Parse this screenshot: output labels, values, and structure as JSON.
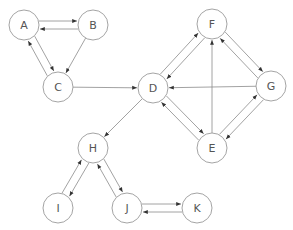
{
  "diagram": {
    "type": "directed-graph",
    "node_radius": 15,
    "colors": {
      "node_stroke": "#9a9a9a",
      "edge": "#8a8a8a",
      "label": "#555555",
      "background": "#ffffff"
    },
    "nodes": [
      {
        "id": "A",
        "label": "A",
        "x": 24,
        "y": 25
      },
      {
        "id": "B",
        "label": "B",
        "x": 93,
        "y": 25
      },
      {
        "id": "C",
        "label": "C",
        "x": 58,
        "y": 87
      },
      {
        "id": "D",
        "label": "D",
        "x": 153,
        "y": 88
      },
      {
        "id": "F",
        "label": "F",
        "x": 212,
        "y": 24
      },
      {
        "id": "G",
        "label": "G",
        "x": 271,
        "y": 86
      },
      {
        "id": "E",
        "label": "E",
        "x": 212,
        "y": 148
      },
      {
        "id": "H",
        "label": "H",
        "x": 93,
        "y": 148
      },
      {
        "id": "I",
        "label": "I",
        "x": 58,
        "y": 208
      },
      {
        "id": "J",
        "label": "J",
        "x": 127,
        "y": 208
      },
      {
        "id": "K",
        "label": "K",
        "x": 197,
        "y": 208
      }
    ],
    "edges": [
      {
        "from": "A",
        "to": "B",
        "offset": -4
      },
      {
        "from": "B",
        "to": "A",
        "offset": -4
      },
      {
        "from": "A",
        "to": "C",
        "offset": -4
      },
      {
        "from": "C",
        "to": "A",
        "offset": -4
      },
      {
        "from": "B",
        "to": "C",
        "offset": 0
      },
      {
        "from": "C",
        "to": "D",
        "offset": 0
      },
      {
        "from": "D",
        "to": "F",
        "offset": -4
      },
      {
        "from": "F",
        "to": "D",
        "offset": -4
      },
      {
        "from": "F",
        "to": "G",
        "offset": -4
      },
      {
        "from": "G",
        "to": "F",
        "offset": -4
      },
      {
        "from": "G",
        "to": "D",
        "offset": 0
      },
      {
        "from": "E",
        "to": "F",
        "offset": 0
      },
      {
        "from": "D",
        "to": "E",
        "offset": -4
      },
      {
        "from": "E",
        "to": "D",
        "offset": -4
      },
      {
        "from": "E",
        "to": "G",
        "offset": -4
      },
      {
        "from": "G",
        "to": "E",
        "offset": -4
      },
      {
        "from": "D",
        "to": "H",
        "offset": 0
      },
      {
        "from": "H",
        "to": "I",
        "offset": -4
      },
      {
        "from": "I",
        "to": "H",
        "offset": -4
      },
      {
        "from": "H",
        "to": "J",
        "offset": -4
      },
      {
        "from": "J",
        "to": "H",
        "offset": -4
      },
      {
        "from": "J",
        "to": "K",
        "offset": -4
      },
      {
        "from": "K",
        "to": "J",
        "offset": -4
      }
    ]
  }
}
